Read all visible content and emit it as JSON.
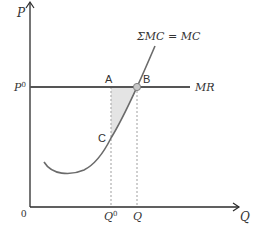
{
  "diagram": {
    "type": "economics-marginal-cost-diagram",
    "colors": {
      "axis": "#2b2b2b",
      "mr_line": "#555555",
      "mc_curve": "#6b6b6b",
      "dashed": "#b0b0b0",
      "shade": "#e4e4e4",
      "point_fill": "#c8c8c8",
      "point_stroke": "#808080",
      "text": "#333333"
    },
    "axes": {
      "y_label": "P",
      "x_label": "Q",
      "origin_label": "0"
    },
    "price_line": {
      "label": "P",
      "label_sup": "0",
      "curve_label": "MR"
    },
    "curve": {
      "label": "ΣMC = MC"
    },
    "points": {
      "a": "A",
      "b": "B",
      "c": "C"
    },
    "quantities": {
      "q0_label": "Q",
      "q0_sup": "0",
      "q_label": "Q"
    }
  }
}
